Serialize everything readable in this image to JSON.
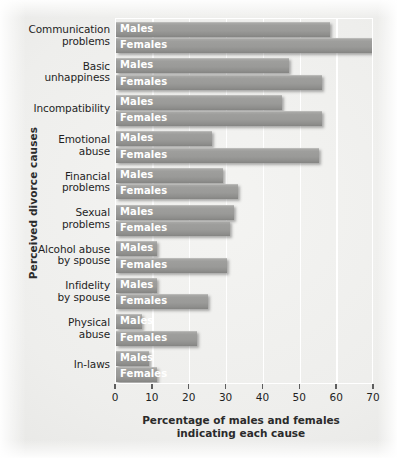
{
  "chart_data": {
    "type": "bar",
    "orientation": "horizontal",
    "title": "",
    "xlabel": "Percentage of males and females indicating each cause",
    "ylabel": "Perceived divorce causes",
    "xlim": [
      0,
      70
    ],
    "xticks": [
      0,
      10,
      20,
      30,
      40,
      50,
      60,
      70
    ],
    "xtick_labels": [
      "0",
      "10",
      "20",
      "30",
      "40",
      "50",
      "60",
      "70"
    ],
    "grid": "vertical-white",
    "legend": "in-bar-labels",
    "categories": [
      "Communication problems",
      "Basic unhappiness",
      "Incompatibility",
      "Emotional abuse",
      "Financial problems",
      "Sexual problems",
      "Alcohol abuse by spouse",
      "Infidelity by spouse",
      "Physical abuse",
      "In-laws"
    ],
    "series": [
      {
        "name": "Males",
        "values": [
          58,
          47,
          45,
          26,
          29,
          32,
          11,
          11,
          7,
          9
        ]
      },
      {
        "name": "Females",
        "values": [
          70,
          56,
          56,
          55,
          33,
          31,
          30,
          25,
          22,
          11
        ]
      }
    ],
    "bar_color": "#9a9a98",
    "bar_label_color": "#ffffff",
    "gridline_color": "#ffffff",
    "background_color": "#eeeeec"
  },
  "axis": {
    "y_title": "Perceived divorce causes",
    "x_title_line1": "Percentage of males and females",
    "x_title_line2": "indicating each cause"
  },
  "categories_wrapped": [
    [
      "Communication",
      "problems"
    ],
    [
      "Basic",
      "unhappiness"
    ],
    [
      "Incompatibility"
    ],
    [
      "Emotional",
      "abuse"
    ],
    [
      "Financial",
      "problems"
    ],
    [
      "Sexual",
      "problems"
    ],
    [
      "Alcohol abuse",
      "by spouse"
    ],
    [
      "Infidelity",
      "by spouse"
    ],
    [
      "Physical",
      "abuse"
    ],
    [
      "In-laws"
    ]
  ]
}
